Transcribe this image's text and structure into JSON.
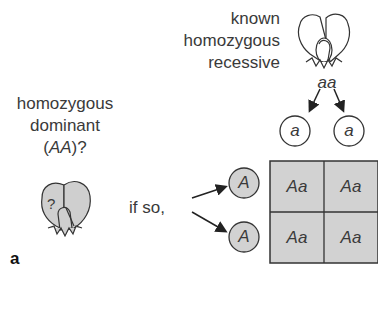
{
  "known_label": [
    "known",
    "homozygous",
    "recessive"
  ],
  "recessive_genotype": "aa",
  "dominant_label": [
    "homozygous",
    "dominant"
  ],
  "dominant_genotype_pre": "(",
  "dominant_genotype": "AA",
  "dominant_genotype_post": ")?",
  "unknown_mark": "?",
  "if_so_label": "if so,",
  "panel_label": "a",
  "gametes_top": [
    "a",
    "a"
  ],
  "gametes_left": [
    "A",
    "A"
  ],
  "punnett": [
    [
      "Aa",
      "Aa"
    ],
    [
      "Aa",
      "Aa"
    ]
  ],
  "colors": {
    "fill_gray": "#d2d2d2",
    "stroke": "#333333"
  }
}
